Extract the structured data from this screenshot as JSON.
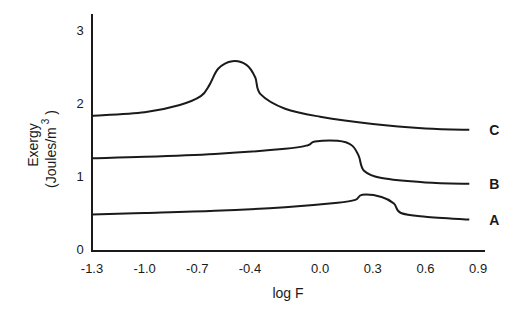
{
  "chart_data": {
    "type": "line",
    "title": "",
    "xlabel": "log F",
    "ylabel": "Exergy",
    "ylabel_units": "(Joules/m",
    "ylabel_units_sup": "3",
    "ylabel_units_close": ")",
    "xlim": [
      -1.3,
      0.9
    ],
    "ylim": [
      0,
      3.1
    ],
    "grid": false,
    "legend_position": "inline-right",
    "x_ticks": [
      "-1.3",
      "-1.0",
      "-0.7",
      "-0.4",
      "0.0",
      "0.3",
      "0.6",
      "0.9"
    ],
    "x_tick_values": [
      -1.3,
      -1.0,
      -0.7,
      -0.4,
      0.0,
      0.3,
      0.6,
      0.9
    ],
    "y_ticks": [
      "0",
      "1",
      "2",
      "3"
    ],
    "y_tick_values": [
      0,
      1,
      2,
      3
    ],
    "series": [
      {
        "name": "C",
        "label": "C",
        "points": [
          [
            -1.3,
            1.85
          ],
          [
            -1.0,
            1.9
          ],
          [
            -0.8,
            2.0
          ],
          [
            -0.68,
            2.12
          ],
          [
            -0.63,
            2.28
          ],
          [
            -0.58,
            2.5
          ],
          [
            -0.5,
            2.6
          ],
          [
            -0.42,
            2.55
          ],
          [
            -0.37,
            2.38
          ],
          [
            -0.34,
            2.15
          ],
          [
            -0.2,
            1.95
          ],
          [
            0.0,
            1.84
          ],
          [
            0.3,
            1.74
          ],
          [
            0.6,
            1.68
          ],
          [
            0.85,
            1.66
          ]
        ]
      },
      {
        "name": "B",
        "label": "B",
        "points": [
          [
            -1.3,
            1.27
          ],
          [
            -1.0,
            1.29
          ],
          [
            -0.6,
            1.33
          ],
          [
            -0.2,
            1.4
          ],
          [
            -0.07,
            1.45
          ],
          [
            -0.03,
            1.5
          ],
          [
            0.1,
            1.51
          ],
          [
            0.18,
            1.45
          ],
          [
            0.22,
            1.3
          ],
          [
            0.25,
            1.1
          ],
          [
            0.35,
            1.0
          ],
          [
            0.6,
            0.94
          ],
          [
            0.85,
            0.92
          ]
        ]
      },
      {
        "name": "A",
        "label": "A",
        "points": [
          [
            -1.3,
            0.5
          ],
          [
            -1.0,
            0.52
          ],
          [
            -0.6,
            0.55
          ],
          [
            -0.2,
            0.6
          ],
          [
            0.1,
            0.66
          ],
          [
            0.2,
            0.7
          ],
          [
            0.24,
            0.77
          ],
          [
            0.35,
            0.74
          ],
          [
            0.42,
            0.65
          ],
          [
            0.46,
            0.52
          ],
          [
            0.6,
            0.47
          ],
          [
            0.85,
            0.43
          ]
        ]
      }
    ]
  }
}
